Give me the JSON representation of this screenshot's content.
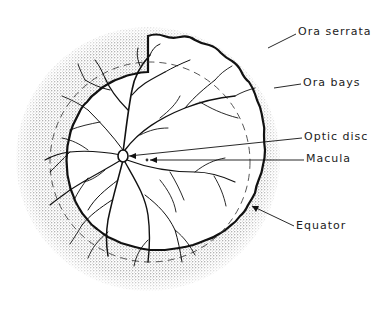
{
  "diagram": {
    "colors": {
      "ink": "#1a1a1a",
      "stipple": "#555555",
      "background": "#ffffff"
    },
    "labels": [
      {
        "id": "ora-serrata",
        "text": "Ora serrata",
        "x": 298,
        "y": 30
      },
      {
        "id": "ora-bays",
        "text": "Ora bays",
        "x": 303,
        "y": 80
      },
      {
        "id": "optic-disc",
        "text": "Optic disc",
        "x": 304,
        "y": 134
      },
      {
        "id": "macula",
        "text": "Macula",
        "x": 306,
        "y": 156
      },
      {
        "id": "equator",
        "text": "Equator",
        "x": 296,
        "y": 223
      }
    ]
  }
}
